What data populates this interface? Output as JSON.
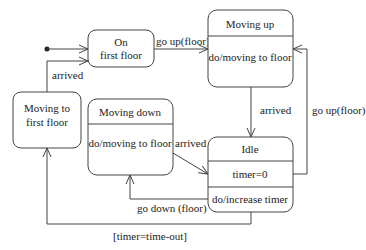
{
  "diagram": {
    "type": "uml-state-machine",
    "states": [
      {
        "id": "on_first_floor",
        "name_line1": "On",
        "name_line2": "first floor"
      },
      {
        "id": "moving_up",
        "name": "Moving up",
        "activity": "do/moving to floor"
      },
      {
        "id": "moving_to_first_floor",
        "name_line1": "Moving to",
        "name_line2": "first floor"
      },
      {
        "id": "moving_down",
        "name": "Moving down",
        "activity": "do/moving to floor"
      },
      {
        "id": "idle",
        "name": "Idle",
        "entry": "timer=0",
        "activity": "do/increase timer"
      }
    ],
    "transitions": [
      {
        "from": "initial",
        "to": "on_first_floor",
        "label": ""
      },
      {
        "from": "on_first_floor",
        "to": "moving_up",
        "label": "go up(floor)"
      },
      {
        "from": "moving_up",
        "to": "idle",
        "label": "arrived"
      },
      {
        "from": "idle",
        "to": "moving_up",
        "label": "go up(floor)"
      },
      {
        "from": "moving_down",
        "to": "idle",
        "label": "arrived"
      },
      {
        "from": "idle",
        "to": "moving_down",
        "label": "go down (floor)"
      },
      {
        "from": "idle",
        "to": "moving_to_first_floor",
        "label": "[timer=time-out]"
      },
      {
        "from": "moving_to_first_floor",
        "to": "on_first_floor",
        "label": "arrived"
      }
    ]
  }
}
